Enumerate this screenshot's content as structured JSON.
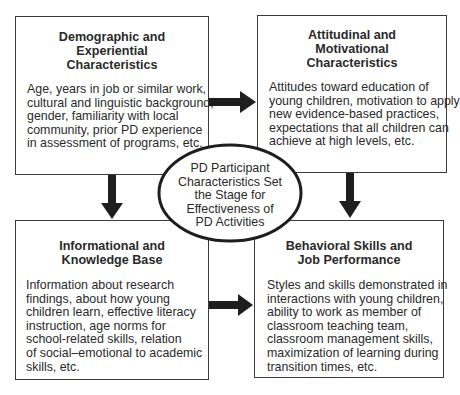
{
  "diagram": {
    "center": {
      "lines": [
        "PD Participant",
        "Characteristics Set",
        "the Stage for",
        "Effectiveness of",
        "PD Activities"
      ]
    },
    "boxes": {
      "demographic": {
        "title_lines": [
          "Demographic and",
          "Experiential",
          "Characteristics"
        ],
        "body_lines": [
          "Age, years in job or similar work,",
          "cultural and linguistic background,",
          "gender, familiarity with local",
          "community, prior PD experience",
          "in assessment of programs, etc."
        ]
      },
      "attitudinal": {
        "title_lines": [
          "Attitudinal and",
          "Motivational",
          "Characteristics"
        ],
        "body_lines": [
          "Attitudes toward education of",
          "young children, motivation to apply",
          "new evidence-based practices,",
          "expectations that all children can",
          "achieve at high levels, etc."
        ]
      },
      "informational": {
        "title_lines": [
          "Informational and",
          "Knowledge Base"
        ],
        "body_lines": [
          "Information about research",
          "findings, about how young",
          "children learn, effective literacy",
          "instruction, age norms for",
          "school-related skills, relation",
          "of social–emotional to academic",
          "skills, etc."
        ]
      },
      "behavioral": {
        "title_lines": [
          "Behavioral Skills and",
          "Job Performance"
        ],
        "body_lines": [
          "Styles and skills demonstrated in",
          "interactions with young children,",
          "ability to work as member of",
          "classroom teaching team,",
          "classroom management skills,",
          "maximization of learning during",
          "transition times, etc."
        ]
      }
    },
    "arrows": [
      {
        "from": "demographic",
        "to": "attitudinal",
        "direction": "right"
      },
      {
        "from": "demographic",
        "to": "informational",
        "direction": "down"
      },
      {
        "from": "attitudinal",
        "to": "behavioral",
        "direction": "down"
      },
      {
        "from": "informational",
        "to": "behavioral",
        "direction": "right"
      }
    ],
    "colors": {
      "line": "#1e1e1e",
      "box_border": "#3a3a3a",
      "text": "#2a2a2a",
      "background": "#ffffff"
    }
  }
}
